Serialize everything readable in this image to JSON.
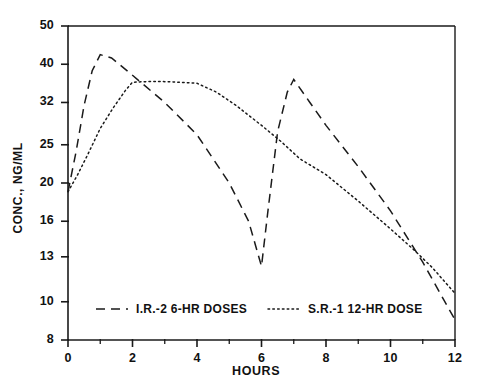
{
  "chart_data": {
    "type": "line",
    "title": "",
    "xlabel": "HOURS",
    "ylabel": "CONC., NG/ML",
    "yscale": "log",
    "xlim": [
      0,
      12
    ],
    "ylim": [
      8,
      50
    ],
    "grid": false,
    "legend_position": "bottom-inside",
    "xticks": [
      0,
      2,
      4,
      6,
      8,
      10,
      12
    ],
    "xtick_labels": [
      "0",
      "2",
      "4",
      "6",
      "8",
      "10",
      "12"
    ],
    "xminor_ticks": [
      1,
      3,
      5,
      7,
      9,
      11
    ],
    "yticks": [
      8,
      10,
      13,
      16,
      20,
      25,
      32,
      40,
      50
    ],
    "ytick_labels": [
      "8",
      "10",
      "13",
      "16",
      "20",
      "25",
      "32",
      "40",
      "50"
    ],
    "series": [
      {
        "name": "I.R.-2 6-HR DOSES",
        "style": "dashed",
        "color": "#1a1a1a",
        "points": [
          [
            0.0,
            19.0
          ],
          [
            0.25,
            24.0
          ],
          [
            0.5,
            31.5
          ],
          [
            0.75,
            38.5
          ],
          [
            1.0,
            42.3
          ],
          [
            1.35,
            41.5
          ],
          [
            2.0,
            37.5
          ],
          [
            3.0,
            32.0
          ],
          [
            4.0,
            26.5
          ],
          [
            5.0,
            20.0
          ],
          [
            5.6,
            16.0
          ],
          [
            6.0,
            12.3
          ],
          [
            6.2,
            17.0
          ],
          [
            6.5,
            27.0
          ],
          [
            6.8,
            34.0
          ],
          [
            7.0,
            36.6
          ],
          [
            7.5,
            32.0
          ],
          [
            8.0,
            28.0
          ],
          [
            9.0,
            22.0
          ],
          [
            10.0,
            17.0
          ],
          [
            11.0,
            12.6
          ],
          [
            12.0,
            9.0
          ]
        ]
      },
      {
        "name": "S.R.-1 12-HR DOSE",
        "style": "dotted",
        "color": "#1a1a1a",
        "points": [
          [
            0.0,
            19.0
          ],
          [
            0.3,
            21.0
          ],
          [
            0.6,
            23.5
          ],
          [
            1.0,
            27.5
          ],
          [
            1.4,
            31.0
          ],
          [
            1.8,
            34.5
          ],
          [
            2.0,
            36.0
          ],
          [
            2.6,
            36.2
          ],
          [
            3.2,
            36.1
          ],
          [
            4.0,
            35.8
          ],
          [
            4.6,
            34.0
          ],
          [
            5.2,
            31.5
          ],
          [
            6.0,
            28.0
          ],
          [
            6.6,
            25.5
          ],
          [
            7.2,
            23.0
          ],
          [
            8.0,
            21.0
          ],
          [
            9.0,
            18.0
          ],
          [
            10.0,
            15.3
          ],
          [
            10.7,
            13.6
          ],
          [
            11.3,
            12.2
          ],
          [
            12.0,
            10.5
          ]
        ]
      }
    ],
    "legend": [
      {
        "label": "I.R.-2 6-HR DOSES",
        "style": "dashed"
      },
      {
        "label": "S.R.-1 12-HR DOSE",
        "style": "dotted"
      }
    ]
  },
  "axes": {
    "ylabel": "CONC., NG/ML",
    "xlabel": "HOURS"
  }
}
